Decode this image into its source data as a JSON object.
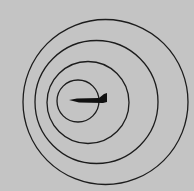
{
  "diagram": {
    "description": "Sound wavefronts emitted by a moving jet aircraft (Doppler effect)",
    "background_color": "#c4c4c4",
    "stroke_color": "#1c1c1c",
    "wavefronts": [
      {
        "cx": 105.5,
        "cy": 102,
        "r": 82.5
      },
      {
        "cx": 96.5,
        "cy": 102,
        "r": 61.5
      },
      {
        "cx": 88,
        "cy": 102.5,
        "r": 41
      },
      {
        "cx": 78,
        "cy": 101,
        "r": 21
      }
    ],
    "aircraft": {
      "icon": "jet-icon",
      "color": "#111111",
      "nose": [
        69,
        100
      ],
      "tail": [
        107,
        94
      ]
    }
  }
}
